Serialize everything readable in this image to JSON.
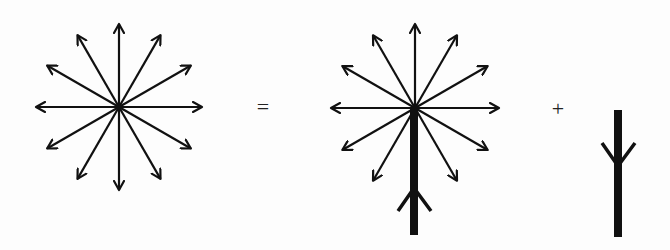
{
  "diagram": {
    "type": "vector-decomposition",
    "equation": {
      "equals_symbol": "=",
      "plus_symbol": "+"
    },
    "colors": {
      "stroke": "#111111",
      "background": "#fdfdfd"
    },
    "figures": [
      {
        "id": "full-star",
        "description": "12 arrows radiating from a center point at 30-degree intervals",
        "center": [
          119,
          107
        ],
        "radius": 83,
        "arrow_count": 12,
        "arrow_angles_deg": [
          0,
          30,
          60,
          90,
          120,
          150,
          180,
          210,
          240,
          270,
          300,
          330
        ]
      },
      {
        "id": "star-with-bar",
        "description": "11 arrows radiating from center (downward arrow removed) plus a thick downward bar with an upward-pointing chevron",
        "center": [
          415,
          108
        ],
        "radius": 84,
        "arrow_count": 11,
        "arrow_angles_deg": [
          0,
          30,
          60,
          90,
          120,
          150,
          180,
          210,
          240,
          300,
          330
        ],
        "bar": {
          "x": 414,
          "y_top": 108,
          "y_bottom": 235,
          "width": 8
        },
        "chevron": {
          "direction": "up",
          "apex": [
            414,
            188
          ],
          "left_arm": [
            398,
            211
          ],
          "right_arm": [
            431,
            211
          ]
        }
      },
      {
        "id": "single-bar",
        "description": "Thick vertical bar with a downward-pointing chevron",
        "bar": {
          "x": 618,
          "y_top": 110,
          "y_bottom": 237,
          "width": 8
        },
        "chevron": {
          "direction": "down",
          "apex": [
            618,
            166
          ],
          "left_arm": [
            602,
            143
          ],
          "right_arm": [
            635,
            143
          ]
        }
      }
    ],
    "operators": [
      {
        "id": "equals",
        "symbol_ref": "equals_symbol",
        "position": [
          263,
          107
        ]
      },
      {
        "id": "plus",
        "symbol_ref": "plus_symbol",
        "position": [
          558,
          109
        ]
      }
    ]
  }
}
